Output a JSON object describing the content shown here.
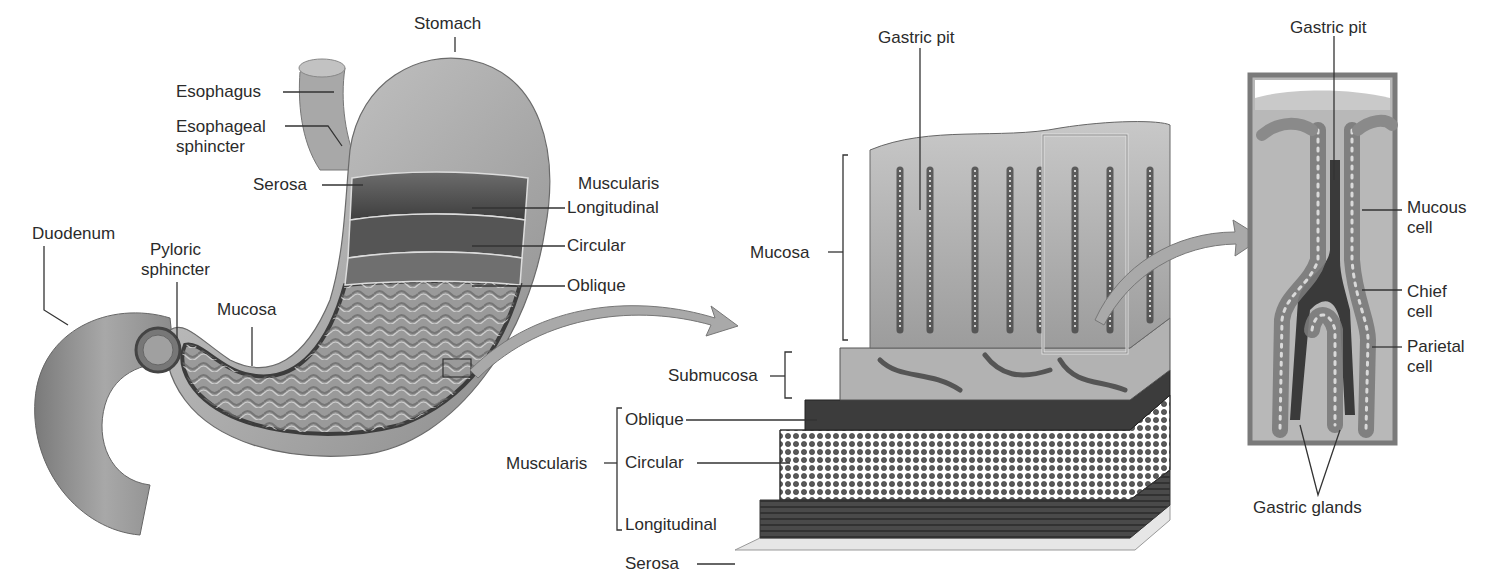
{
  "stomach_panel": {
    "labels": {
      "stomach": "Stomach",
      "esophagus": "Esophagus",
      "esophageal_sphincter_1": "Esophageal",
      "esophageal_sphincter_2": "sphincter",
      "serosa": "Serosa",
      "muscularis": "Muscularis",
      "longitudinal": "Longitudinal",
      "circular": "Circular",
      "oblique": "Oblique",
      "duodenum": "Duodenum",
      "pyloric_sphincter_1": "Pyloric",
      "pyloric_sphincter_2": "sphincter",
      "mucosa": "Mucosa"
    }
  },
  "wall_panel": {
    "labels": {
      "gastric_pit": "Gastric pit",
      "mucosa": "Mucosa",
      "submucosa": "Submucosa",
      "muscularis": "Muscularis",
      "oblique": "Oblique",
      "circular": "Circular",
      "longitudinal": "Longitudinal",
      "serosa": "Serosa"
    }
  },
  "gland_panel": {
    "labels": {
      "gastric_pit": "Gastric pit",
      "mucous_cell_1": "Mucous",
      "mucous_cell_2": "cell",
      "chief_cell_1": "Chief",
      "chief_cell_2": "cell",
      "parietal_cell_1": "Parietal",
      "parietal_cell_2": "cell",
      "gastric_glands": "Gastric glands"
    }
  },
  "colors": {
    "tissue_light": "#bdbdbd",
    "tissue_mid": "#8f8f8f",
    "tissue_dark": "#4a4a4a",
    "arrow_fill": "#a9a9a9",
    "leader_line": "#333333"
  }
}
